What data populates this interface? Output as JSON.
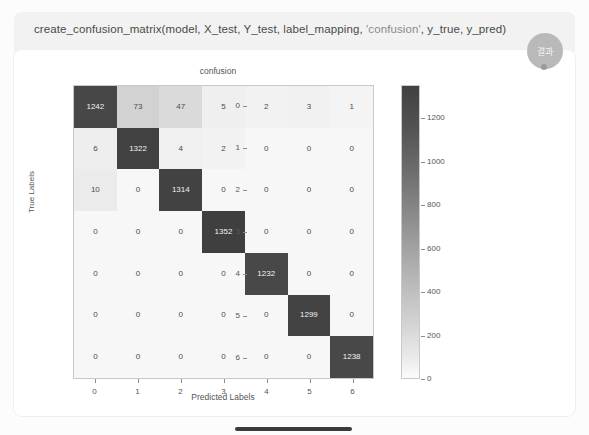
{
  "code_cell": {
    "call_prefix": "create_confusion_matrix(model, X_test, Y_test, label_mapping, ",
    "string_arg": "'confusion'",
    "call_suffix": ", y_true, y_pred)"
  },
  "badge": {
    "label": "결과"
  },
  "chart_data": {
    "type": "heatmap",
    "title": "confusion",
    "xlabel": "Predicted Labels",
    "ylabel": "True Labels",
    "x_ticks": [
      "0",
      "1",
      "2",
      "3",
      "4",
      "5",
      "6"
    ],
    "y_ticks": [
      "0",
      "1",
      "2",
      "3",
      "4",
      "5",
      "6"
    ],
    "colorbar_ticks": [
      "1200",
      "1000",
      "800",
      "600",
      "400",
      "200",
      "0"
    ],
    "colorbar_range": [
      0,
      1352
    ],
    "grid": false,
    "legend_position": "right-colorbar",
    "colormap": "Greys",
    "matrix": [
      [
        1242,
        73,
        47,
        5,
        2,
        3,
        1
      ],
      [
        6,
        1322,
        4,
        2,
        0,
        0,
        0
      ],
      [
        10,
        0,
        1314,
        0,
        0,
        0,
        0
      ],
      [
        0,
        0,
        0,
        1352,
        0,
        0,
        0
      ],
      [
        0,
        0,
        0,
        0,
        1232,
        0,
        0
      ],
      [
        0,
        0,
        0,
        0,
        0,
        1299,
        0
      ],
      [
        0,
        0,
        0,
        0,
        0,
        0,
        1238
      ]
    ]
  },
  "colors": {
    "cell_low": "#f4f4f4",
    "cell_high": "#414141",
    "code_strip": "#f2f2f2",
    "badge": "#b9b9b9"
  }
}
